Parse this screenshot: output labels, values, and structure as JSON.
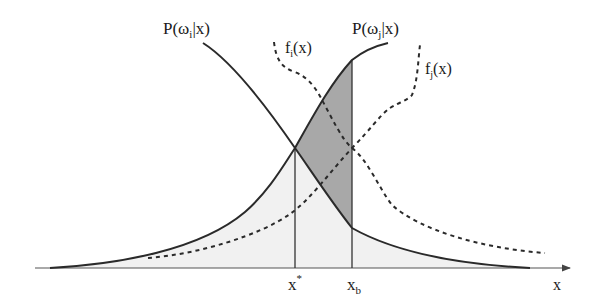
{
  "diagram": {
    "labels": {
      "posterior_i": {
        "base": "P(ω",
        "sub": "i",
        "tail": "|x)"
      },
      "posterior_j": {
        "base": "P(ω",
        "sub": "j",
        "tail": "|x)"
      },
      "density_i": {
        "base": "f",
        "sub": "i",
        "tail": "(x)"
      },
      "density_j": {
        "base": "f",
        "sub": "j",
        "tail": "(x)"
      },
      "x_star": {
        "base": "x",
        "sup": "*"
      },
      "x_b": {
        "base": "x",
        "sub": "b"
      },
      "x_axis": "x"
    },
    "colors": {
      "curve": "#2a2a2a",
      "dashed": "#2a2a2a",
      "shaded_region": "#a8a8a8",
      "light_region": "#f1f1f1",
      "axis": "#555555"
    },
    "curves": [
      {
        "name": "P(ω_i|x)",
        "style": "solid",
        "shape": "decreasing sigmoid"
      },
      {
        "name": "P(ω_j|x)",
        "style": "solid",
        "shape": "increasing sigmoid"
      },
      {
        "name": "f_i(x)",
        "style": "dashed",
        "shape": "decreasing density"
      },
      {
        "name": "f_j(x)",
        "style": "dashed",
        "shape": "increasing density"
      }
    ],
    "markers": [
      {
        "name": "x*",
        "meaning": "intersection of posteriors (optimal boundary)"
      },
      {
        "name": "x_b",
        "meaning": "chosen boundary"
      }
    ]
  }
}
